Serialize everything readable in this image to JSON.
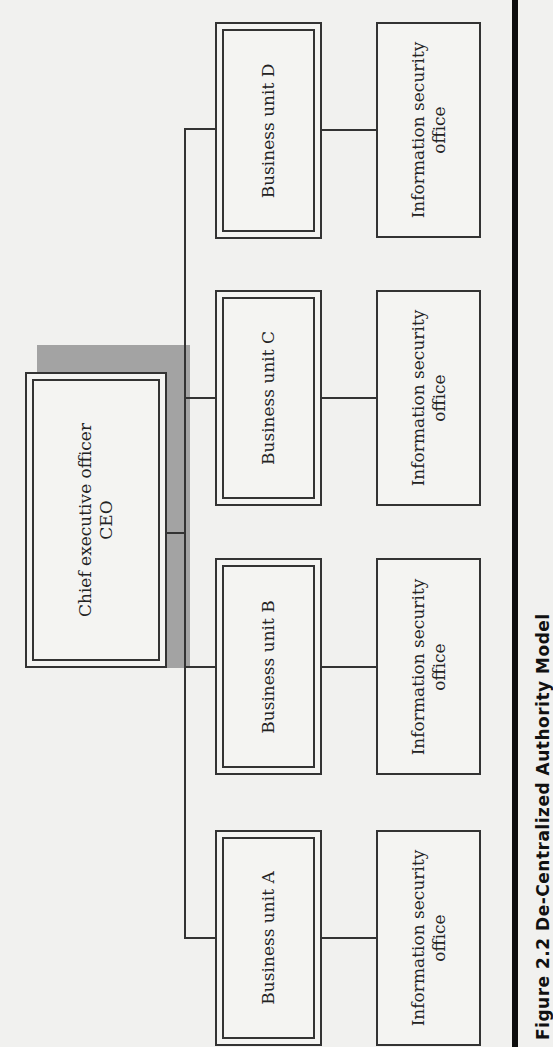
{
  "diagram": {
    "ceo": {
      "line1": "Chief executive officer",
      "line2": "CEO"
    },
    "business_units": [
      {
        "label": "Business unit D"
      },
      {
        "label": "Business unit C"
      },
      {
        "label": "Business unit B"
      },
      {
        "label": "Business unit A"
      }
    ],
    "security_offices": [
      {
        "line1": "Information security",
        "line2": "office"
      },
      {
        "line1": "Information security",
        "line2": "office"
      },
      {
        "line1": "Information security",
        "line2": "office"
      },
      {
        "line1": "Information security",
        "line2": "office"
      }
    ],
    "caption": "Figure 2.2   De-Centralized Authority Model"
  },
  "colors": {
    "shade": "#a3a3a3",
    "line": "#333333",
    "background": "#f1f1ef"
  }
}
